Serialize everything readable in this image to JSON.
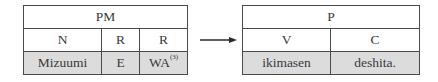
{
  "left_table": {
    "header": "PM",
    "categories": [
      "N",
      "R",
      "R"
    ],
    "words": [
      "Mizuumi",
      "E",
      "WA"
    ],
    "footnote_marker": "(3)"
  },
  "arrow": {
    "direction": "right"
  },
  "right_table": {
    "header": "P",
    "categories": [
      "V",
      "C"
    ],
    "words": [
      "ikimasen",
      "deshita."
    ]
  },
  "colors": {
    "border": "#4a4a4a",
    "shade": "#dcdcdc",
    "text": "#3a3a3a"
  }
}
